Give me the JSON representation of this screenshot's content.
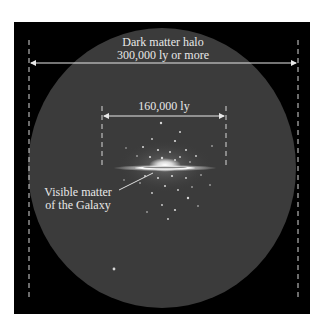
{
  "diagram": {
    "halo": {
      "label_line1": "Dark matter halo",
      "label_line2": "300,000 ly or more"
    },
    "disk": {
      "label": "160,000 ly"
    },
    "visible_matter": {
      "label_line1": "Visible matter",
      "label_line2": "of the Galaxy"
    },
    "colors": {
      "background": "#000000",
      "halo": "#3b3b3b",
      "annotation": "#e8e8e8",
      "galaxy": "#ffffff"
    }
  }
}
